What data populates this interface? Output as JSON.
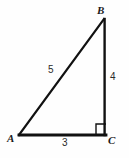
{
  "figure": {
    "kind": "right-triangle-diagram",
    "background_color": "#fefefe",
    "stroke_color": "#111111",
    "label_color": "#1a1a1a",
    "width": 129,
    "height": 158
  },
  "vertices": {
    "a": {
      "label": "A",
      "x": 19,
      "y": 135
    },
    "b": {
      "label": "B",
      "x": 104,
      "y": 19
    },
    "c": {
      "label": "C",
      "x": 105,
      "y": 135
    }
  },
  "sides": {
    "hypotenuse": {
      "label": "5",
      "from": "A",
      "to": "B"
    },
    "vertical": {
      "label": "4",
      "from": "B",
      "to": "C"
    },
    "base": {
      "label": "3",
      "from": "A",
      "to": "C"
    }
  },
  "right_angle": {
    "at_vertex": "C",
    "marker": "square"
  }
}
